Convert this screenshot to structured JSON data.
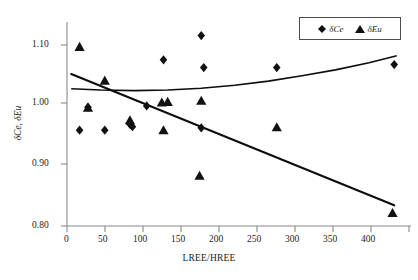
{
  "chart_data": {
    "type": "scatter",
    "title": "",
    "xlabel": "LREE/HREE",
    "ylabel": "δCe, δEu",
    "xlim": [
      0,
      410
    ],
    "ylim": [
      0.8,
      1.145
    ],
    "xticks": [
      0,
      50,
      100,
      150,
      200,
      250,
      300,
      350,
      400
    ],
    "xticklabels": [
      "0",
      "50",
      "100",
      "150",
      "200",
      "250",
      "300",
      "350",
      "400"
    ],
    "yticks": [
      0.8,
      0.9,
      1.0,
      1.1
    ],
    "yticklabels": [
      "0.80",
      "0.90",
      "1.00",
      "1.10"
    ],
    "grid": false,
    "legend_position": "top-right",
    "series": [
      {
        "name": "δCe",
        "marker": "diamond",
        "color": "#111111",
        "points": [
          [
            15,
            0.962
          ],
          [
            25,
            1.001
          ],
          [
            45,
            0.962
          ],
          [
            75,
            0.972
          ],
          [
            78,
            0.968
          ],
          [
            95,
            1.003
          ],
          [
            115,
            1.081
          ],
          [
            160,
            1.122
          ],
          [
            160,
            0.966
          ],
          [
            163,
            1.068
          ],
          [
            250,
            1.068
          ],
          [
            390,
            1.073
          ]
        ],
        "trendline": {
          "shape": "quadratic-upward",
          "points": [
            [
              5,
              1.032
            ],
            [
              40,
              1.03
            ],
            [
              80,
              1.029
            ],
            [
              120,
              1.03
            ],
            [
              160,
              1.033
            ],
            [
              200,
              1.038
            ],
            [
              240,
              1.045
            ],
            [
              280,
              1.054
            ],
            [
              320,
              1.064
            ],
            [
              360,
              1.076
            ],
            [
              393,
              1.088
            ]
          ]
        }
      },
      {
        "name": "δEu",
        "marker": "triangle",
        "color": "#111111",
        "points": [
          [
            15,
            1.103
          ],
          [
            25,
            1.0
          ],
          [
            45,
            1.046
          ],
          [
            75,
            0.979
          ],
          [
            113,
            1.009
          ],
          [
            120,
            1.01
          ],
          [
            115,
            0.962
          ],
          [
            160,
            1.012
          ],
          [
            158,
            0.885
          ],
          [
            250,
            0.967
          ],
          [
            388,
            0.822
          ]
        ],
        "trendline": {
          "shape": "linear-downward",
          "points": [
            [
              5,
              1.057
            ],
            [
              390,
              0.835
            ]
          ]
        }
      }
    ]
  },
  "legend": {
    "items": [
      {
        "label_symbol": "δ",
        "label_text": "Ce",
        "marker": "diamond-marker"
      },
      {
        "label_symbol": "δ",
        "label_text": "Eu",
        "marker": "triangle-marker"
      }
    ]
  },
  "axes": {
    "x_title": "LREE/HREE",
    "y_title_symbol1": "δ",
    "y_title_text1": "Ce, ",
    "y_title_symbol2": "δ",
    "y_title_text2": "Eu"
  },
  "colors": {
    "axis": "#7a7a7a",
    "marker": "#111111",
    "trendline": "#0d0d0d",
    "background": "#ffffff",
    "text": "#1c1c1c"
  }
}
